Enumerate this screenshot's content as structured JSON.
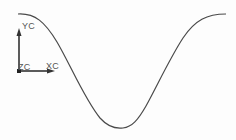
{
  "viewport": {
    "background": "#fdfdfd",
    "curve_color": "#4a4a4a",
    "curve_type": "cosine",
    "curve_points": {
      "start": [
        18,
        14
      ],
      "min": [
        123,
        128
      ],
      "end": [
        226,
        14
      ]
    }
  },
  "triad": {
    "x_label": "XC",
    "y_label": "YC",
    "z_label": "ZC",
    "color": "#333333"
  }
}
